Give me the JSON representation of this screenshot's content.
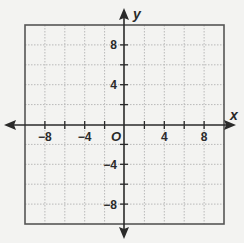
{
  "chart_data": {
    "type": "coordinate-plane",
    "title": "",
    "xlabel": "x",
    "ylabel": "y",
    "origin_label": "O",
    "xlim": [
      -10,
      10
    ],
    "ylim": [
      -10,
      10
    ],
    "grid": true,
    "grid_step": 2,
    "x_tick_labels": [
      {
        "value": -8,
        "label": "−8"
      },
      {
        "value": -4,
        "label": "−4"
      },
      {
        "value": 4,
        "label": "4"
      },
      {
        "value": 8,
        "label": "8"
      }
    ],
    "y_tick_labels": [
      {
        "value": 8,
        "label": "8"
      },
      {
        "value": 4,
        "label": "4"
      },
      {
        "value": -4,
        "label": "−4"
      },
      {
        "value": -8,
        "label": "−8"
      }
    ],
    "series": []
  },
  "colors": {
    "background": "#f3f3f1",
    "grid": "#b9b9b9",
    "border": "#555555",
    "axis": "#2a2a2a"
  }
}
